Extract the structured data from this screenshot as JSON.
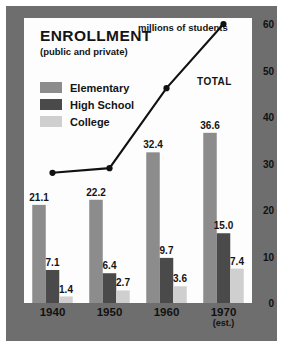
{
  "chart_data": {
    "type": "bar",
    "title": "ENROLLMENT",
    "subtitle": "(public and private)",
    "ylabel": "millions of students",
    "xlabel": "",
    "categories": [
      "1940",
      "1950",
      "1960",
      "1970"
    ],
    "category_notes": [
      "",
      "",
      "",
      "(est.)"
    ],
    "ylim": [
      0,
      60
    ],
    "yticks": [
      0,
      10,
      20,
      30,
      40,
      50,
      60
    ],
    "ytick_labels": [
      "0",
      "10",
      "20",
      "30",
      "40",
      "50",
      "60"
    ],
    "grid": false,
    "legend_position": "upper-left",
    "series": [
      {
        "name": "Elementary",
        "values": [
          21.1,
          22.2,
          32.4,
          36.6
        ],
        "color": "#8c8c8c"
      },
      {
        "name": "High School",
        "values": [
          7.1,
          6.4,
          9.7,
          15.0
        ],
        "color": "#4a4a4a"
      },
      {
        "name": "College",
        "values": [
          1.4,
          2.7,
          3.6,
          7.4
        ],
        "color": "#cfcfcf"
      }
    ],
    "overlay_line": {
      "name": "TOTAL",
      "values": [
        28.0,
        29.0,
        46.2,
        60.0
      ],
      "color": "#111111",
      "marker": "circle"
    },
    "annotations": [
      {
        "text": "TOTAL",
        "target": "overlay_line"
      },
      {
        "text": "millions of students",
        "target": "y-axis"
      }
    ]
  },
  "legend": {
    "items": [
      {
        "label": "Elementary",
        "color": "#8c8c8c"
      },
      {
        "label": "High School",
        "color": "#4a4a4a"
      },
      {
        "label": "College",
        "color": "#cfcfcf"
      }
    ]
  },
  "colors": {
    "frame": "#6e6e6e",
    "canvas": "#fdfdfd",
    "page": "#ffffff",
    "text": "#141414",
    "line": "#111111"
  }
}
